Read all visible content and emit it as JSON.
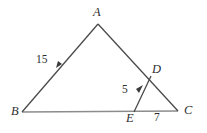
{
  "figure": {
    "type": "geometry-diagram",
    "background_color": "#ffffff",
    "stroke_color": "#4a4a4a",
    "baseline_color": "#8c8c8c",
    "text_color": "#2e2e2e",
    "points": {
      "A": {
        "label": "A",
        "x": 98,
        "y": 22
      },
      "B": {
        "label": "B",
        "x": 22,
        "y": 112
      },
      "C": {
        "label": "C",
        "x": 178,
        "y": 111
      },
      "D": {
        "label": "D",
        "x": 150,
        "y": 77
      },
      "E": {
        "label": "E",
        "x": 135,
        "y": 112
      }
    },
    "segments": [
      {
        "name": "BA",
        "from": "B",
        "to": "A",
        "tick_arrow": true
      },
      {
        "name": "AC",
        "from": "A",
        "to": "C",
        "tick_arrow": false
      },
      {
        "name": "BC",
        "from": "B",
        "to": "C",
        "tick_arrow": false
      },
      {
        "name": "ED",
        "from": "E",
        "to": "D",
        "tick_arrow": true
      }
    ],
    "measures": [
      {
        "name": "BA-length",
        "value": "15",
        "segment": "BA"
      },
      {
        "name": "ED-length",
        "value": "5",
        "segment": "ED"
      },
      {
        "name": "EC-length",
        "value": "7",
        "segment": "EC"
      }
    ]
  }
}
